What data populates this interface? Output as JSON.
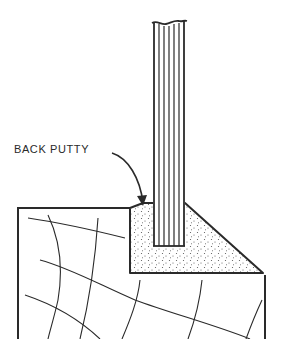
{
  "diagram": {
    "labels": {
      "back_putty": "BACK PUTTY"
    },
    "components": [
      "glass-pane",
      "back-putty",
      "sash-frame",
      "wood-grain"
    ],
    "colors": {
      "line": "#2a2a2a",
      "background": "#ffffff",
      "stipple": "#555555"
    }
  }
}
